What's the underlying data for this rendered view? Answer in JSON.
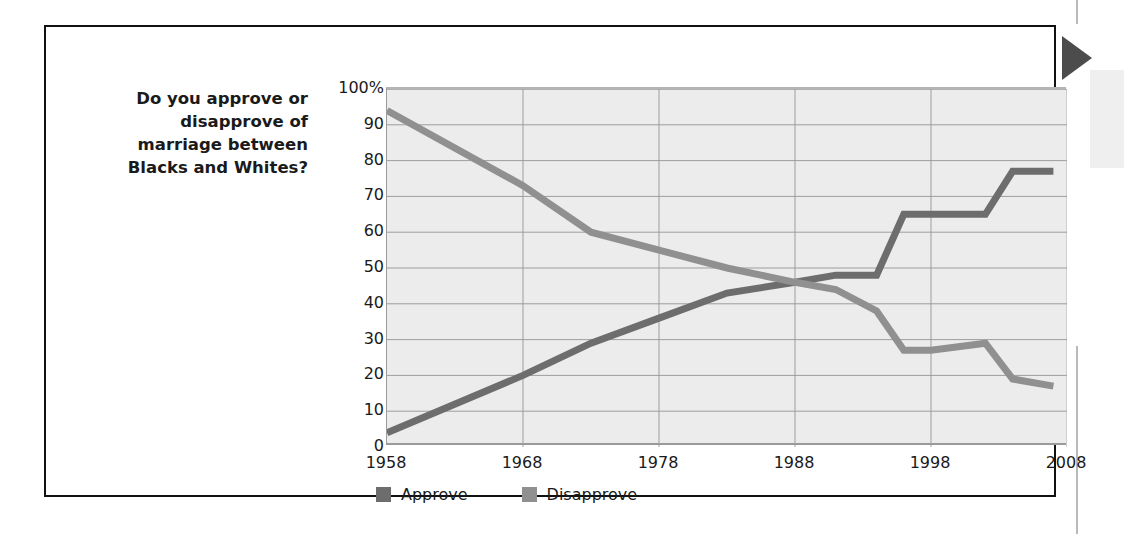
{
  "caption": {
    "question": "Do you approve or disapprove of marriage between Blacks and Whites?"
  },
  "marker": {
    "name": "right-pointing-triangle",
    "color": "#4c4c4c"
  },
  "colors": {
    "approve": "#6d6d6d",
    "disapprove": "#909090",
    "plot_background": "#ececec",
    "gridline": "#9d9d9d",
    "card_border": "#111111",
    "text": "#1a1a1a"
  },
  "legend": {
    "position": "bottom",
    "items": [
      {
        "label": "Approve",
        "color": "#6d6d6d"
      },
      {
        "label": "Disapprove",
        "color": "#909090"
      }
    ]
  },
  "chart_data": {
    "type": "line",
    "title": "",
    "subtitle": "",
    "xlabel": "",
    "ylabel": "",
    "xlim": [
      1958,
      2008
    ],
    "ylim": [
      0,
      100
    ],
    "grid": true,
    "x_ticks": [
      1958,
      1968,
      1978,
      1988,
      1998,
      2008
    ],
    "x_tick_labels": [
      "1958",
      "1968",
      "1978",
      "1988",
      "1998",
      "2008"
    ],
    "y_ticks": [
      0,
      10,
      20,
      30,
      40,
      50,
      60,
      70,
      80,
      90,
      100
    ],
    "y_tick_labels": [
      "0",
      "10",
      "20",
      "30",
      "40",
      "50",
      "60",
      "70",
      "80",
      "90",
      "100%"
    ],
    "series": [
      {
        "name": "Approve",
        "color": "#6d6d6d",
        "points": [
          [
            1958,
            4
          ],
          [
            1968,
            20
          ],
          [
            1973,
            29
          ],
          [
            1978,
            36
          ],
          [
            1983,
            43
          ],
          [
            1988,
            46
          ],
          [
            1991,
            48
          ],
          [
            1994,
            48
          ],
          [
            1996,
            65
          ],
          [
            1998,
            65
          ],
          [
            2002,
            65
          ],
          [
            2004,
            77
          ],
          [
            2007,
            77
          ]
        ]
      },
      {
        "name": "Disapprove",
        "color": "#909090",
        "points": [
          [
            1958,
            94
          ],
          [
            1968,
            73
          ],
          [
            1973,
            60
          ],
          [
            1978,
            55
          ],
          [
            1983,
            50
          ],
          [
            1988,
            46
          ],
          [
            1991,
            44
          ],
          [
            1994,
            38
          ],
          [
            1996,
            27
          ],
          [
            1998,
            27
          ],
          [
            2002,
            29
          ],
          [
            2004,
            19
          ],
          [
            2007,
            17
          ]
        ]
      }
    ]
  }
}
